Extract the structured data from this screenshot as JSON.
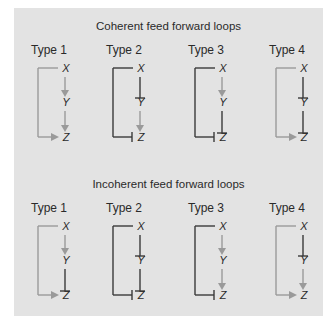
{
  "colors": {
    "background": "#ffffff",
    "panel": "#e3e3e3",
    "activation": "#9a9a9a",
    "repression": "#3a3a3a",
    "text": "#2a2a2a"
  },
  "legend_semantics": {
    "activation": "gray arrow",
    "repression": "dark bar-ended line (⊣)"
  },
  "sections": [
    {
      "title": "Coherent feed forward loops",
      "types": [
        {
          "label": "Type 1",
          "nodes": [
            "X",
            "Y",
            "Z"
          ],
          "x_to_y": "activation",
          "y_to_z": "activation",
          "x_to_z": "activation"
        },
        {
          "label": "Type 2",
          "nodes": [
            "X",
            "Y",
            "Z"
          ],
          "x_to_y": "repression",
          "y_to_z": "activation",
          "x_to_z": "repression"
        },
        {
          "label": "Type 3",
          "nodes": [
            "X",
            "Y",
            "Z"
          ],
          "x_to_y": "activation",
          "y_to_z": "repression",
          "x_to_z": "repression"
        },
        {
          "label": "Type 4",
          "nodes": [
            "X",
            "Y",
            "Z"
          ],
          "x_to_y": "repression",
          "y_to_z": "repression",
          "x_to_z": "activation"
        }
      ]
    },
    {
      "title": "Incoherent feed forward loops",
      "types": [
        {
          "label": "Type 1",
          "nodes": [
            "X",
            "Y",
            "Z"
          ],
          "x_to_y": "activation",
          "y_to_z": "repression",
          "x_to_z": "activation"
        },
        {
          "label": "Type 2",
          "nodes": [
            "X",
            "Y",
            "Z"
          ],
          "x_to_y": "repression",
          "y_to_z": "repression",
          "x_to_z": "repression"
        },
        {
          "label": "Type 3",
          "nodes": [
            "X",
            "Y",
            "Z"
          ],
          "x_to_y": "activation",
          "y_to_z": "activation",
          "x_to_z": "repression"
        },
        {
          "label": "Type 4",
          "nodes": [
            "X",
            "Y",
            "Z"
          ],
          "x_to_y": "repression",
          "y_to_z": "activation",
          "x_to_z": "activation"
        }
      ]
    }
  ]
}
